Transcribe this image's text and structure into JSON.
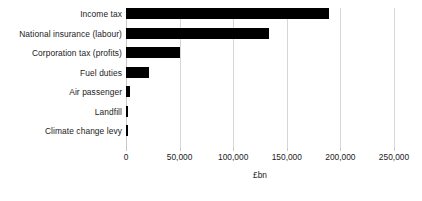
{
  "chart_data": {
    "type": "bar",
    "orientation": "horizontal",
    "title": "",
    "xlabel": "£bn",
    "ylabel": "",
    "categories": [
      "Income tax",
      "National insurance (labour)",
      "Corporation tax (profits)",
      "Fuel duties",
      "Air passenger",
      "Landfill",
      "Climate change levy"
    ],
    "values": [
      189000,
      133000,
      50000,
      21500,
      3500,
      1500,
      2000
    ],
    "series": [
      {
        "name": "",
        "values": [
          189000,
          133000,
          50000,
          21500,
          3500,
          1500,
          2000
        ]
      }
    ],
    "xlim": [
      0,
      250000
    ],
    "xticks": [
      0,
      50000,
      100000,
      150000,
      200000,
      250000
    ],
    "xtick_labels": [
      "0",
      "50,000",
      "100,000",
      "150,000",
      "200,000",
      "250,000"
    ],
    "grid": "vertical",
    "legend": "none",
    "bar_color": "#000000",
    "gridline_color": "#d6d6d6"
  },
  "axis": {
    "x_title": "£bn"
  }
}
